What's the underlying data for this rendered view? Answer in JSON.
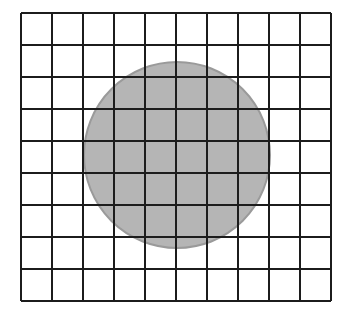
{
  "diagram": {
    "type": "grid-with-circle",
    "grid": {
      "columns": 10,
      "rows": 9,
      "x": 21,
      "y": 13,
      "cell_width": 31,
      "cell_height": 32,
      "line_color": "#1c1c1c",
      "line_width": 2
    },
    "circle": {
      "cx": 177,
      "cy": 155,
      "r": 93,
      "fill": "#b5b5b5",
      "stroke": "#9a9a9a",
      "stroke_width": 2
    },
    "background": "#ffffff"
  }
}
